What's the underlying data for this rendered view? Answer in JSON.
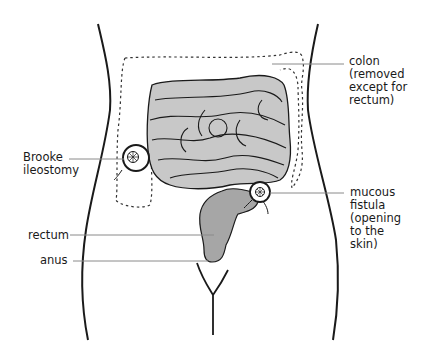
{
  "diagram": {
    "labels": {
      "colon": "colon\n(removed\nexcept for\nrectum)",
      "brooke": "Brooke\nileostomy",
      "mucous": "mucous\nfistula\n(opening\nto the\nskin)",
      "rectum": "rectum",
      "anus": "anus"
    },
    "colors": {
      "outline": "#1a1a1a",
      "intestine_fill": "#c8c8c8",
      "rectum_fill": "#a6a6a6",
      "leader_line": "#8a8a8a",
      "dashed_colon": "#333333"
    }
  }
}
